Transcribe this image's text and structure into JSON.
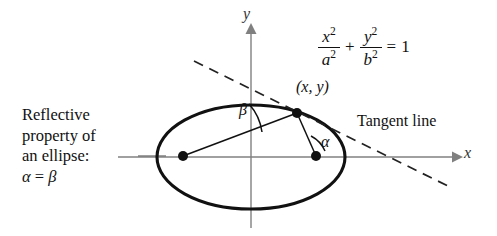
{
  "figure": {
    "title": "Reflective property of an ellipse",
    "background_color": "#ffffff",
    "ink_color": "#111111",
    "axis_color": "#777777"
  },
  "caption": {
    "line1": "Reflective",
    "line2": "property of",
    "line3": "an ellipse:",
    "line4_alpha": "α",
    "line4_equals": "=",
    "line4_beta": "β"
  },
  "equation": {
    "x_num": "x",
    "x_num_sup": "2",
    "a_den": "a",
    "a_den_sup": "2",
    "plus": "+",
    "y_num": "y",
    "y_num_sup": "2",
    "b_den": "b",
    "b_den_sup": "2",
    "equals": "=",
    "rhs": "1",
    "full_text": "x^2/a^2 + y^2/b^2 = 1"
  },
  "labels": {
    "point": "(x, y)",
    "tangent": "Tangent line",
    "y_axis": "y",
    "x_axis": "x",
    "alpha": "α",
    "beta": "β"
  },
  "geometry": {
    "ellipse": {
      "cx": 251,
      "cy": 157,
      "rx": 94,
      "ry": 52
    },
    "focus_left": {
      "x": 183,
      "y": 156
    },
    "focus_right": {
      "x": 316,
      "y": 156
    },
    "tangent_point": {
      "x": 297,
      "y": 113
    },
    "tangent_line": {
      "x1": 194,
      "y1": 61,
      "x2": 452,
      "y2": 188
    },
    "x_axis": {
      "x1": 118,
      "y1": 157,
      "x2": 458,
      "y2": 157
    },
    "y_axis": {
      "x1": 251,
      "y1": 24,
      "x2": 251,
      "y2": 228
    },
    "leader_line": {
      "x1": 140,
      "y1": 156,
      "x2": 165,
      "y2": 156
    }
  }
}
